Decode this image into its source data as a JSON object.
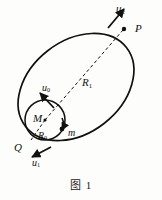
{
  "figure": {
    "caption": "图 1",
    "type": "orbital-transfer-diagram",
    "background_color": "#fdfdfc",
    "stroke_color": "#111111"
  },
  "labels": {
    "u2": {
      "text": "u",
      "sub": "2",
      "role": "velocity-at-apoapsis"
    },
    "P": {
      "text": "P",
      "sub": "",
      "role": "apoapsis-point"
    },
    "R1": {
      "text": "R",
      "sub": "1",
      "role": "outer-orbit-radius"
    },
    "u0": {
      "text": "u",
      "sub": "0",
      "role": "initial-circular-velocity"
    },
    "M": {
      "text": "M",
      "sub": "",
      "role": "central-body-mass"
    },
    "R0": {
      "text": "R",
      "sub": "0",
      "role": "inner-circle-radius"
    },
    "m": {
      "text": "m",
      "sub": "",
      "role": "orbiting-body-mass"
    },
    "Q": {
      "text": "Q",
      "sub": "",
      "role": "periapsis-point"
    },
    "u1": {
      "text": "u",
      "sub": "1",
      "role": "velocity-at-periapsis"
    }
  },
  "geometry": {
    "ellipse": {
      "center_x": 76,
      "center_y": 87,
      "radius_x": 64,
      "radius_y": 46,
      "rotation_deg": -38
    },
    "circle": {
      "center_x": 45,
      "center_y": 120,
      "radius": 20
    },
    "dashed_radius_line": {
      "x1": 45,
      "y1": 120,
      "x2": 123,
      "y2": 30
    },
    "dashed_r0_line": {
      "x1": 45,
      "y1": 120,
      "x2": 31,
      "y2": 140
    }
  }
}
